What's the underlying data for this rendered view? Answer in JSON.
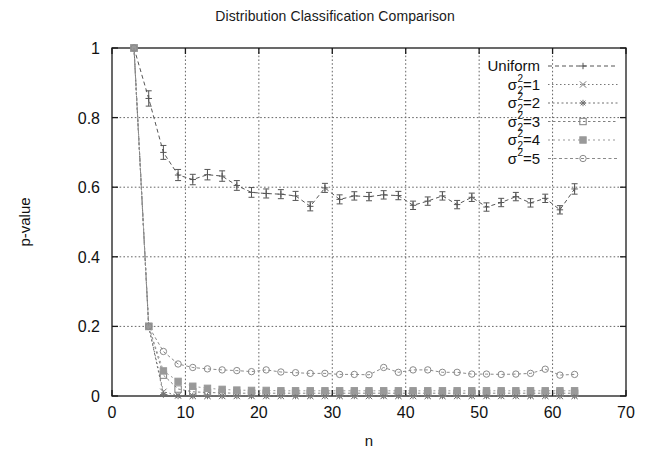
{
  "chart_data": {
    "type": "line",
    "title": "Distribution Classification Comparison",
    "xlabel": "n",
    "ylabel": "p-value",
    "xlim": [
      0,
      70
    ],
    "ylim": [
      0,
      1
    ],
    "xticks": [
      "0",
      "10",
      "20",
      "30",
      "40",
      "50",
      "60",
      "70"
    ],
    "xtick_values": [
      0,
      10,
      20,
      30,
      40,
      50,
      60,
      70
    ],
    "yticks": [
      "0",
      "0.2",
      "0.4",
      "0.6",
      "0.8",
      "1"
    ],
    "ytick_values": [
      0,
      0.2,
      0.4,
      0.6,
      0.8,
      1
    ],
    "grid": true,
    "grid_style": "dotted",
    "legend_position": "top-right",
    "errorbars": true,
    "x": [
      3,
      5,
      7,
      9,
      11,
      13,
      15,
      17,
      19,
      21,
      23,
      25,
      27,
      29,
      31,
      33,
      35,
      37,
      39,
      41,
      43,
      45,
      47,
      49,
      51,
      53,
      55,
      57,
      59,
      61,
      63
    ],
    "series": [
      {
        "name": "Uniform",
        "label": "Uniform",
        "marker": "plus",
        "color": "#555555",
        "values": [
          1.0,
          0.855,
          0.7,
          0.635,
          0.622,
          0.636,
          0.632,
          0.605,
          0.585,
          0.582,
          0.58,
          0.575,
          0.545,
          0.598,
          0.565,
          0.575,
          0.573,
          0.578,
          0.576,
          0.548,
          0.56,
          0.575,
          0.55,
          0.571,
          0.543,
          0.556,
          0.573,
          0.555,
          0.568,
          0.535,
          0.595
        ],
        "errors": [
          0.0,
          0.022,
          0.02,
          0.016,
          0.015,
          0.015,
          0.015,
          0.014,
          0.014,
          0.013,
          0.013,
          0.013,
          0.013,
          0.013,
          0.013,
          0.012,
          0.012,
          0.012,
          0.012,
          0.012,
          0.012,
          0.012,
          0.012,
          0.012,
          0.012,
          0.012,
          0.012,
          0.012,
          0.012,
          0.012,
          0.015
        ]
      },
      {
        "name": "sigma2_1",
        "label": "σ²=1",
        "marker": "cross",
        "color": "#777777",
        "values": [
          1.0,
          0.2,
          0.012,
          0.002,
          0.0,
          0.0,
          0.0,
          0.0,
          0.0,
          0.0,
          0.0,
          0.0,
          0.0,
          0.0,
          0.0,
          0.0,
          0.0,
          0.0,
          0.0,
          0.0,
          0.0,
          0.0,
          0.0,
          0.0,
          0.0,
          0.0,
          0.0,
          0.0,
          0.0,
          0.0,
          0.0
        ],
        "errors": [
          0.0,
          0.0,
          0.0,
          0.0,
          0.0,
          0.0,
          0.0,
          0.0,
          0.0,
          0.0,
          0.0,
          0.0,
          0.0,
          0.0,
          0.0,
          0.0,
          0.0,
          0.0,
          0.0,
          0.0,
          0.0,
          0.0,
          0.0,
          0.0,
          0.0,
          0.0,
          0.0,
          0.0,
          0.0,
          0.0,
          0.0
        ]
      },
      {
        "name": "sigma2_2",
        "label": "σ²=2",
        "marker": "star",
        "color": "#707070",
        "values": [
          1.0,
          0.2,
          0.004,
          0.0,
          0.0,
          0.0,
          0.0,
          0.0,
          0.0,
          0.0,
          0.0,
          0.0,
          0.0,
          0.0,
          0.0,
          0.0,
          0.0,
          0.0,
          0.0,
          0.0,
          0.0,
          0.0,
          0.0,
          0.0,
          0.0,
          0.0,
          0.0,
          0.0,
          0.0,
          0.0,
          0.0
        ],
        "errors": [
          0.0,
          0.0,
          0.0,
          0.0,
          0.0,
          0.0,
          0.0,
          0.0,
          0.0,
          0.0,
          0.0,
          0.0,
          0.0,
          0.0,
          0.0,
          0.0,
          0.0,
          0.0,
          0.0,
          0.0,
          0.0,
          0.0,
          0.0,
          0.0,
          0.0,
          0.0,
          0.0,
          0.0,
          0.0,
          0.0,
          0.0
        ]
      },
      {
        "name": "sigma2_3",
        "label": "σ²=3",
        "marker": "open-square",
        "color": "#808080",
        "values": [
          1.0,
          0.2,
          0.06,
          0.02,
          0.012,
          0.01,
          0.009,
          0.008,
          0.008,
          0.008,
          0.008,
          0.008,
          0.008,
          0.008,
          0.008,
          0.008,
          0.008,
          0.008,
          0.008,
          0.008,
          0.008,
          0.008,
          0.008,
          0.008,
          0.008,
          0.008,
          0.008,
          0.008,
          0.008,
          0.008,
          0.008
        ],
        "errors": [
          0.0,
          0.0,
          0.0,
          0.0,
          0.0,
          0.0,
          0.0,
          0.0,
          0.0,
          0.0,
          0.0,
          0.0,
          0.0,
          0.0,
          0.0,
          0.0,
          0.0,
          0.0,
          0.0,
          0.0,
          0.0,
          0.0,
          0.0,
          0.0,
          0.0,
          0.0,
          0.0,
          0.0,
          0.0,
          0.0,
          0.0
        ]
      },
      {
        "name": "sigma2_4",
        "label": "σ²=4",
        "marker": "filled-square",
        "color": "#999999",
        "values": [
          1.0,
          0.2,
          0.072,
          0.042,
          0.028,
          0.022,
          0.019,
          0.017,
          0.016,
          0.016,
          0.015,
          0.015,
          0.015,
          0.015,
          0.015,
          0.015,
          0.015,
          0.015,
          0.015,
          0.015,
          0.015,
          0.015,
          0.015,
          0.015,
          0.015,
          0.015,
          0.015,
          0.015,
          0.015,
          0.015,
          0.015
        ],
        "errors": [
          0.0,
          0.0,
          0.0,
          0.0,
          0.0,
          0.0,
          0.0,
          0.0,
          0.0,
          0.0,
          0.0,
          0.0,
          0.0,
          0.0,
          0.0,
          0.0,
          0.0,
          0.0,
          0.0,
          0.0,
          0.0,
          0.0,
          0.0,
          0.0,
          0.0,
          0.0,
          0.0,
          0.0,
          0.0,
          0.0,
          0.0
        ]
      },
      {
        "name": "sigma2_5",
        "label": "σ²=5",
        "marker": "open-circle",
        "color": "#8a8a8a",
        "values": [
          1.0,
          0.2,
          0.128,
          0.092,
          0.082,
          0.078,
          0.075,
          0.073,
          0.07,
          0.075,
          0.069,
          0.067,
          0.065,
          0.065,
          0.062,
          0.062,
          0.061,
          0.082,
          0.068,
          0.075,
          0.075,
          0.068,
          0.068,
          0.063,
          0.063,
          0.062,
          0.063,
          0.065,
          0.077,
          0.06,
          0.062
        ],
        "errors": [
          0.0,
          0.0,
          0.0,
          0.0,
          0.0,
          0.0,
          0.0,
          0.0,
          0.0,
          0.0,
          0.0,
          0.0,
          0.0,
          0.0,
          0.0,
          0.0,
          0.0,
          0.0,
          0.0,
          0.0,
          0.0,
          0.0,
          0.0,
          0.0,
          0.0,
          0.0,
          0.0,
          0.0,
          0.0,
          0.0,
          0.0
        ]
      }
    ]
  },
  "legend": {
    "entries": [
      {
        "label": "Uniform",
        "base": "Uniform",
        "sup": "",
        "sub": "",
        "eq": ""
      },
      {
        "label": "σ²=1",
        "base": "σ",
        "sup": "2",
        "sub": "2",
        "eq": "=1"
      },
      {
        "label": "σ²=2",
        "base": "σ",
        "sup": "2",
        "sub": "2",
        "eq": "=2"
      },
      {
        "label": "σ²=3",
        "base": "σ",
        "sup": "2",
        "sub": "2",
        "eq": "=3"
      },
      {
        "label": "σ²=4",
        "base": "σ",
        "sup": "2",
        "sub": "2",
        "eq": "=4"
      },
      {
        "label": "σ²=5",
        "base": "σ",
        "sup": "2",
        "sub": "",
        "eq": "=5"
      }
    ]
  },
  "colors": {
    "axis": "#1a1a1a",
    "grid": "#666666",
    "background": "#ffffff",
    "text": "#111111"
  }
}
